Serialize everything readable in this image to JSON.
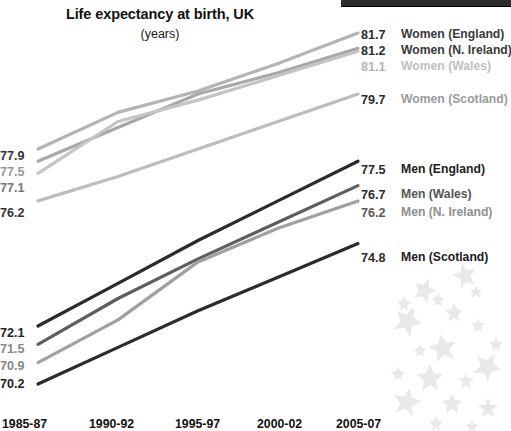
{
  "chart_data": {
    "type": "line",
    "title": "Life expectancy at birth, UK",
    "subtitle": "(years)",
    "xlabel": "",
    "ylabel": "",
    "grid": false,
    "legend_position": "right-of-plot-end-labels",
    "categories": [
      "1985-87",
      "1990-92",
      "1995-97",
      "2000-02",
      "2005-07"
    ],
    "ylim": [
      69.5,
      82.5
    ],
    "series": [
      {
        "name": "Women (England)",
        "color": "#b4b4b4",
        "start_value": 77.9,
        "end_value": 81.7,
        "values": [
          77.9,
          79.1,
          79.8,
          80.7,
          81.7
        ]
      },
      {
        "name": "Women (N. Ireland)",
        "color": "#a8a8a8",
        "start_value": 77.5,
        "end_value": 81.2,
        "values": [
          77.5,
          78.6,
          79.7,
          80.4,
          81.2
        ]
      },
      {
        "name": "Women (Wales)",
        "color": "#c4c4c4",
        "start_value": 77.1,
        "end_value": 81.1,
        "values": [
          77.1,
          78.8,
          79.5,
          80.3,
          81.1
        ]
      },
      {
        "name": "Women (Scotland)",
        "color": "#bdbdbd",
        "start_value": 76.2,
        "end_value": 79.7,
        "values": [
          76.2,
          77.0,
          77.9,
          78.8,
          79.7
        ]
      },
      {
        "name": "Men (England)",
        "color": "#2b2b2b",
        "start_value": 72.1,
        "end_value": 77.5,
        "values": [
          72.1,
          73.5,
          74.9,
          76.2,
          77.5
        ]
      },
      {
        "name": "Men (Wales)",
        "color": "#5e5e5e",
        "start_value": 71.5,
        "end_value": 76.7,
        "values": [
          71.5,
          73.0,
          74.3,
          75.5,
          76.7
        ]
      },
      {
        "name": "Men (N. Ireland)",
        "color": "#a0a0a0",
        "start_value": 70.9,
        "end_value": 76.2,
        "values": [
          70.9,
          72.3,
          74.2,
          75.3,
          76.2
        ]
      },
      {
        "name": "Men (Scotland)",
        "color": "#2b2b2b",
        "start_value": 70.2,
        "end_value": 74.8,
        "values": [
          70.2,
          71.4,
          72.6,
          73.7,
          74.8
        ]
      }
    ]
  },
  "labels": {
    "left_values": [
      {
        "text": "77.9",
        "color": "#333333"
      },
      {
        "text": "77.5",
        "color": "#999999"
      },
      {
        "text": "77.1",
        "color": "#777777"
      },
      {
        "text": "76.2",
        "color": "#333333"
      },
      {
        "text": "72.1",
        "color": "#222222"
      },
      {
        "text": "71.5",
        "color": "#888888"
      },
      {
        "text": "70.9",
        "color": "#888888"
      },
      {
        "text": "70.2",
        "color": "#222222"
      }
    ],
    "right_values": [
      {
        "text": "81.7",
        "color": "#2b2b2b"
      },
      {
        "text": "81.2",
        "color": "#2b2b2b"
      },
      {
        "text": "81.1",
        "color": "#b4b4b4"
      },
      {
        "text": "79.7",
        "color": "#2b2b2b"
      },
      {
        "text": "77.5",
        "color": "#2b2b2b"
      },
      {
        "text": "76.7",
        "color": "#2b2b2b"
      },
      {
        "text": "76.2",
        "color": "#5a5a5a"
      },
      {
        "text": "74.8",
        "color": "#2b2b2b"
      }
    ],
    "series_names": [
      {
        "text": "Women (England)",
        "color": "#3a3a3a"
      },
      {
        "text": "Women (N. Ireland)",
        "color": "#3a3a3a"
      },
      {
        "text": "Women (Wales)",
        "color": "#c0c0c0"
      },
      {
        "text": "Women (Scotland)",
        "color": "#9a9a9a"
      },
      {
        "text": "Men (England)",
        "color": "#1c1c1c"
      },
      {
        "text": "Men (Wales)",
        "color": "#555555"
      },
      {
        "text": "Men (N. Ireland)",
        "color": "#8f8f8f"
      },
      {
        "text": "Men (Scotland)",
        "color": "#1c1c1c"
      }
    ]
  },
  "xaxis": {
    "ticks": [
      "1985-87",
      "1990-92",
      "1995-97",
      "2000-02",
      "2005-07"
    ]
  }
}
